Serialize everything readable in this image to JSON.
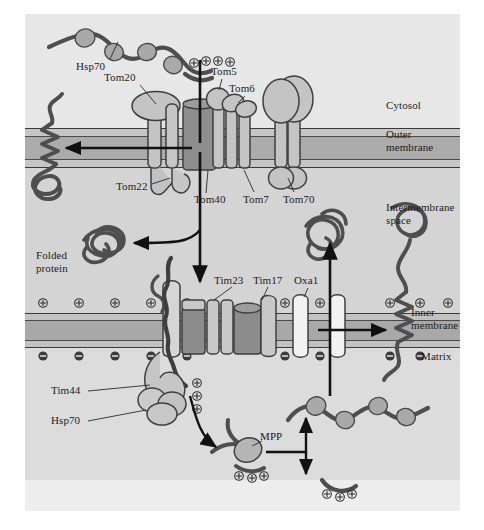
{
  "figure": {
    "background_color": "#ffffff",
    "canvas_color": "#d9d9d9",
    "cytosol_color": "#e8e8e8",
    "intermembrane_color": "#d2d2d2",
    "matrix_color": "#d8d8d8",
    "membrane_color": "#b0b0b0",
    "membrane_line_color": "#3a3a3a",
    "protein_fill": "#bdbdbd",
    "protein_fill_light": "#f0f0f0",
    "protein_fill_dark": "#8f8f8f",
    "chain_color": "#4a4a4a",
    "arrow_color": "#111111",
    "text_color": "#1b1b1b"
  },
  "compartments": [
    {
      "id": "cytosol",
      "label": "Cytosol",
      "x": 387,
      "y": 104
    },
    {
      "id": "outer-membrane",
      "label": "Outer\nmembrane",
      "x": 387,
      "y": 133
    },
    {
      "id": "intermembrane-space",
      "label": "Intermembrane\nspace",
      "x": 387,
      "y": 207
    },
    {
      "id": "inner-membrane",
      "label": "Inner\nmembrane",
      "x": 413,
      "y": 311
    },
    {
      "id": "matrix",
      "label": "Matrix",
      "x": 424,
      "y": 352
    }
  ],
  "outer_membrane_proteins": [
    {
      "id": "tom20",
      "label": "Tom20",
      "x": 117,
      "y": 77
    },
    {
      "id": "tom5",
      "label": "Tom5",
      "x": 216,
      "y": 71
    },
    {
      "id": "tom6",
      "label": "Tom6",
      "x": 233,
      "y": 88
    },
    {
      "id": "tom22",
      "label": "Tom22",
      "x": 121,
      "y": 186
    },
    {
      "id": "tom40",
      "label": "Tom40",
      "x": 199,
      "y": 199
    },
    {
      "id": "tom7",
      "label": "Tom7",
      "x": 248,
      "y": 199
    },
    {
      "id": "tom70",
      "label": "Tom70",
      "x": 287,
      "y": 199
    }
  ],
  "inner_membrane_proteins": [
    {
      "id": "tim23",
      "label": "Tim23",
      "x": 219,
      "y": 280
    },
    {
      "id": "tim17",
      "label": "Tim17",
      "x": 258,
      "y": 280
    },
    {
      "id": "oxa1",
      "label": "Oxa1",
      "x": 299,
      "y": 280
    }
  ],
  "chaperones": [
    {
      "id": "hsp70-cytosolic",
      "label": "Hsp70",
      "x": 80,
      "y": 66
    },
    {
      "id": "tim44",
      "label": "Tim44",
      "x": 54,
      "y": 390
    },
    {
      "id": "hsp70-matrix",
      "label": "Hsp70",
      "x": 54,
      "y": 420
    }
  ],
  "other_labels": [
    {
      "id": "folded-protein",
      "label": "Folded\nprotein",
      "x": 39,
      "y": 255
    },
    {
      "id": "mpp",
      "label": "MPP",
      "x": 264,
      "y": 436
    }
  ],
  "charges": {
    "positive_symbol": "+",
    "negative_symbol": "−",
    "presequence_positive_count": 4,
    "inner_membrane_positive_row_count": 9,
    "inner_membrane_negative_row_count": 9,
    "matrix_presequence_positive_count": 3,
    "cleaved_presequence_positive_count": 3,
    "free_presequence_positive_count": 3
  },
  "flow_arrows": [
    {
      "id": "arrow-outer-membrane-insertion",
      "from": "tom-complex",
      "to": "outer-membrane-helix"
    },
    {
      "id": "arrow-intermembrane-release",
      "from": "tom-complex",
      "to": "folded-protein"
    },
    {
      "id": "arrow-to-tim-complex",
      "from": "tom-complex",
      "to": "tim23-channel"
    },
    {
      "id": "arrow-matrix-to-mpp",
      "from": "tim-exit",
      "to": "mpp-cleavage"
    },
    {
      "id": "arrow-mpp-to-chaperone",
      "from": "mpp-cleavage",
      "to": "matrix-hsp70-chain"
    },
    {
      "id": "arrow-mpp-to-presequence",
      "from": "mpp-cleavage",
      "to": "free-presequence"
    },
    {
      "id": "arrow-matrix-to-oxa1",
      "from": "matrix-chain",
      "to": "oxa1-channel"
    },
    {
      "id": "arrow-oxa1-insertion",
      "from": "oxa1-channel",
      "to": "inner-membrane-helix"
    }
  ]
}
